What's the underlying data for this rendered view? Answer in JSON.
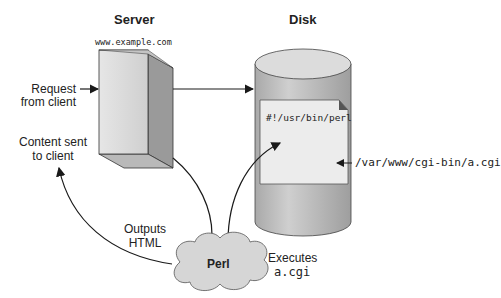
{
  "diagram": {
    "server": {
      "title": "Server",
      "host": "www.example.com"
    },
    "disk": {
      "title": "Disk",
      "shebang": "#!/usr/bin/perl",
      "path": "/var/www/cgi-bin/a.cgi"
    },
    "labels": {
      "request_line1": "Request",
      "request_line2": "from client",
      "content_line1": "Content sent",
      "content_line2": "to client",
      "outputs_line1": "Outputs",
      "outputs_line2": "HTML",
      "executes_line1": "Executes",
      "executes_line2": "a.cgi"
    },
    "perl": {
      "label": "Perl"
    },
    "colors": {
      "box_front": "#d8d8d8",
      "box_side": "#9a9a9a",
      "disk": "#bdbdbd",
      "cloud": "#d6d6d6",
      "line": "#1a1a1a"
    }
  }
}
